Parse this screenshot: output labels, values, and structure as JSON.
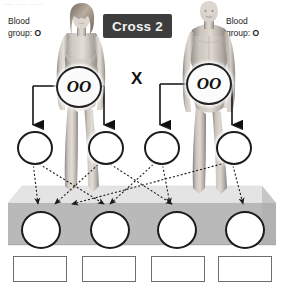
{
  "page": {
    "top_caption": "..... ..... ......",
    "title": "Cross 2"
  },
  "parents": {
    "female": {
      "label_line1": "Blood",
      "label_line2_prefix": "group: ",
      "blood_group": "O",
      "genotype": "OO",
      "sex": "female"
    },
    "male": {
      "label_line1": "Blood",
      "label_line2_prefix": "group: ",
      "blood_group": "O",
      "genotype": "OO",
      "sex": "male"
    },
    "cross_symbol": "X"
  },
  "gametes": [
    {
      "id": "gamete-1",
      "value": ""
    },
    {
      "id": "gamete-2",
      "value": ""
    },
    {
      "id": "gamete-3",
      "value": ""
    },
    {
      "id": "gamete-4",
      "value": ""
    }
  ],
  "offspring": [
    {
      "id": "offspring-1",
      "genotype": ""
    },
    {
      "id": "offspring-2",
      "genotype": ""
    },
    {
      "id": "offspring-3",
      "genotype": ""
    },
    {
      "id": "offspring-4",
      "genotype": ""
    }
  ],
  "answer_boxes": [
    {
      "id": "answer-1",
      "value": ""
    },
    {
      "id": "answer-2",
      "value": ""
    },
    {
      "id": "answer-3",
      "value": ""
    },
    {
      "id": "answer-4",
      "value": ""
    }
  ],
  "colors": {
    "title_background": "#3d3d3d",
    "title_text": "#f2f2f2",
    "text": "#1a1a1a",
    "circle_stroke": "#1c1c1c",
    "box_stroke": "#6e6e6e",
    "platform_top": "#e3e3e3",
    "platform_front": "#b6b6b6",
    "arrow": "#1a1a1a"
  },
  "icons": {
    "female_figure": "female-body-figure",
    "male_figure": "male-body-figure",
    "solid_arrow": "down-arrow-icon",
    "dotted_arrow": "dotted-arrow-icon"
  }
}
